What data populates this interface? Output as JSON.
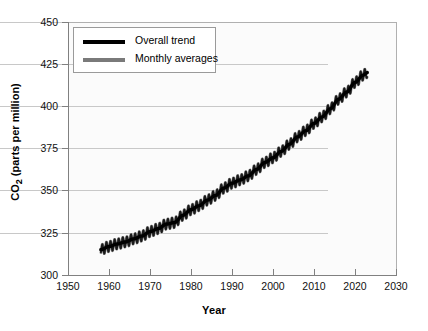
{
  "chart_data": {
    "type": "line",
    "title": "",
    "xlabel": "Year",
    "ylabel": "CO2 (parts per million)",
    "ylabel_base": "CO",
    "ylabel_sub": "2",
    "ylabel_rest": " (parts per million)",
    "xlim": [
      1950,
      2030
    ],
    "ylim": [
      300,
      450
    ],
    "xticks": [
      1950,
      1960,
      1970,
      1980,
      1990,
      2000,
      2010,
      2020,
      2030
    ],
    "yticks": [
      300,
      325,
      350,
      375,
      400,
      425,
      450
    ],
    "grid": "horizontal",
    "legend_position": "top-left",
    "series": [
      {
        "name": "Overall trend",
        "color": "#000000",
        "style": "smooth-trend",
        "x": [
          1958,
          1960,
          1962,
          1964,
          1966,
          1968,
          1970,
          1972,
          1974,
          1976,
          1978,
          1980,
          1982,
          1984,
          1986,
          1988,
          1990,
          1992,
          1994,
          1996,
          1998,
          2000,
          2002,
          2004,
          2006,
          2008,
          2010,
          2012,
          2014,
          2016,
          2018,
          2020,
          2022,
          2023
        ],
        "values": [
          315.0,
          316.9,
          318.4,
          319.6,
          321.4,
          323.1,
          325.7,
          327.5,
          330.2,
          331.1,
          335.4,
          338.7,
          341.1,
          344.4,
          347.2,
          351.5,
          354.4,
          356.4,
          358.8,
          362.6,
          366.7,
          369.5,
          373.3,
          377.5,
          381.9,
          385.6,
          389.9,
          393.8,
          398.6,
          404.2,
          408.5,
          414.2,
          418.5,
          420.0
        ]
      },
      {
        "name": "Monthly averages",
        "color": "#7a7a7a",
        "style": "sawtooth-seasonal",
        "seasonal_amplitude_ppm": 3.2,
        "cycle_period_years": 1,
        "note": "Monthly values oscillate seasonally about the overall trend"
      }
    ],
    "legend": [
      {
        "label": "Overall trend",
        "color": "#000000"
      },
      {
        "label": "Monthly averages",
        "color": "#7a7a7a"
      }
    ],
    "data_start_year": 1958,
    "data_end_year": 2023,
    "value_start_ppm": 315,
    "value_end_ppm": 420
  },
  "colors": {
    "trend": "#000000",
    "monthly": "#7a7a7a",
    "grid": "#c8c8c8",
    "axis": "#808080",
    "plot_background": "#fbfbfb",
    "page_background": "#ffffff"
  }
}
